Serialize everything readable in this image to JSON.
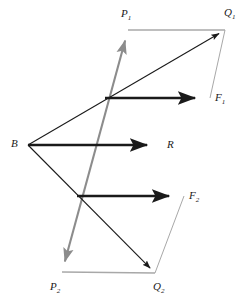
{
  "diagram": {
    "background_color": "#ffffff",
    "colors": {
      "vector_dark": "#1a1a1a",
      "vector_gray": "#8c8c8c",
      "construction_gray": "#a8a8a8",
      "label_color": "#1a1a1a"
    },
    "labels": [
      {
        "name": "label-p1",
        "base": "P",
        "sub": "1",
        "x": 121,
        "y": 8
      },
      {
        "name": "label-q1",
        "base": "Q",
        "sub": "1",
        "x": 224,
        "y": 7
      },
      {
        "name": "label-f1",
        "base": "F",
        "sub": "1",
        "x": 215,
        "y": 92
      },
      {
        "name": "label-b",
        "base": "B",
        "sub": "",
        "x": 11,
        "y": 138
      },
      {
        "name": "label-r",
        "base": "R",
        "sub": "",
        "x": 167,
        "y": 139
      },
      {
        "name": "label-f2",
        "base": "F",
        "sub": "2",
        "x": 189,
        "y": 190
      },
      {
        "name": "label-p2",
        "base": "P",
        "sub": "2",
        "x": 50,
        "y": 281
      },
      {
        "name": "label-q2",
        "base": "Q",
        "sub": "2",
        "x": 153,
        "y": 281
      }
    ],
    "points": {
      "B": {
        "x": 28,
        "y": 145
      },
      "P1": {
        "x": 128,
        "y": 30
      },
      "Q1": {
        "x": 225,
        "y": 30
      },
      "F1": {
        "x": 210,
        "y": 98
      },
      "R": {
        "x": 162,
        "y": 145
      },
      "F2": {
        "x": 184,
        "y": 196
      },
      "P2": {
        "x": 62,
        "y": 272
      },
      "Q2": {
        "x": 155,
        "y": 273
      },
      "X1": {
        "x": 105,
        "y": 98
      },
      "X2": {
        "x": 77,
        "y": 196
      }
    },
    "vectors": [
      {
        "name": "vector-p-axis",
        "from": "P2",
        "to": "P1",
        "style": "gray",
        "arrow": "both",
        "width": 2.1
      },
      {
        "name": "vector-b-to-q1",
        "from": "B",
        "to": "Q1",
        "style": "dark",
        "arrow": "end",
        "width": 1.1
      },
      {
        "name": "vector-b-to-q2",
        "from": "B",
        "to": "Q2",
        "style": "dark",
        "arrow": "end",
        "width": 1.1
      },
      {
        "name": "vector-b-to-r",
        "from": "B",
        "to": "R",
        "style": "dark",
        "arrow": "end",
        "width": 2.4
      },
      {
        "name": "vector-x1-to-f1",
        "from": "X1",
        "to": "F1",
        "style": "dark",
        "arrow": "end",
        "width": 2.4
      },
      {
        "name": "vector-x2-to-f2",
        "from": "X2",
        "to": "F2",
        "style": "dark",
        "arrow": "end",
        "width": 2.4
      },
      {
        "name": "construction-p1-q1",
        "from": "P1",
        "to": "Q1",
        "style": "light",
        "arrow": "none",
        "width": 1.6
      },
      {
        "name": "construction-q1-f1",
        "from": "Q1",
        "to": "F1",
        "style": "light",
        "arrow": "none",
        "width": 1.0
      },
      {
        "name": "construction-p2-q2",
        "from": "P2",
        "to": "Q2",
        "style": "light",
        "arrow": "none",
        "width": 1.6
      },
      {
        "name": "construction-f2-q2",
        "from": "F2",
        "to": "Q2",
        "style": "light",
        "arrow": "none",
        "width": 1.0
      }
    ]
  }
}
